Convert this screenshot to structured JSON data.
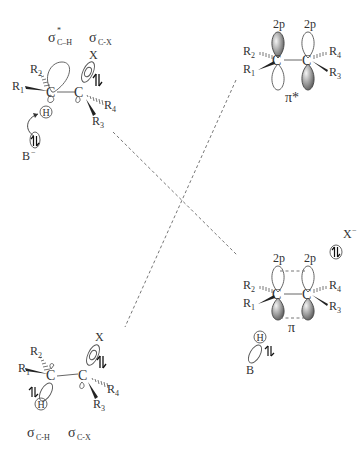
{
  "diagram": {
    "top_left": {
      "label_sigma_star": "σ",
      "label_sigma_star_sup": "*",
      "label_sigma_star_sub": "C–H",
      "label_sigma": "σ",
      "label_sigma_sub": "C-X",
      "atoms": {
        "c1": "C",
        "c2": "C",
        "r1": "R",
        "r1_sub": "1",
        "r2": "R",
        "r2_sub": "2",
        "r3": "R",
        "r3_sub": "3",
        "r4": "R",
        "r4_sub": "4",
        "h": "H",
        "x": "X",
        "base": "B",
        "base_charge": "−"
      }
    },
    "top_right": {
      "label": "π*",
      "orbital_left": "2p",
      "orbital_right": "2p",
      "atoms": {
        "c1": "C",
        "c2": "C",
        "r1": "R",
        "r1_sub": "1",
        "r2": "R",
        "r2_sub": "2",
        "r3": "R",
        "r3_sub": "3",
        "r4": "R",
        "r4_sub": "4"
      }
    },
    "bottom_right": {
      "label": "π",
      "orbital_left": "2p",
      "orbital_right": "2p",
      "leaving_group": "X",
      "leaving_group_charge": "−",
      "atoms": {
        "c1": "C",
        "c2": "C",
        "r1": "R",
        "r1_sub": "1",
        "r2": "R",
        "r2_sub": "2",
        "r3": "R",
        "r3_sub": "3",
        "r4": "R",
        "r4_sub": "4",
        "h": "H",
        "base": "B"
      }
    },
    "bottom_left": {
      "label_sigma_ch": "σ",
      "label_sigma_ch_sub": "C-H",
      "label_sigma_cx": "σ",
      "label_sigma_cx_sub": "C-X",
      "atoms": {
        "c1": "C",
        "c2": "C",
        "r1": "R",
        "r1_sub": "1",
        "r2": "R",
        "r2_sub": "2",
        "r3": "R",
        "r3_sub": "3",
        "r4": "R",
        "r4_sub": "4",
        "h": "H",
        "x": "X"
      }
    },
    "colors": {
      "line": "#777777",
      "text": "#333333",
      "shade_light": "#f4f4f4",
      "shade_dark": "#555555"
    }
  }
}
